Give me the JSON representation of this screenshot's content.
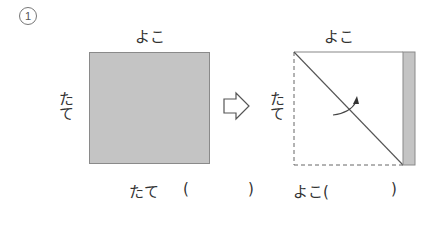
{
  "problem": {
    "number": "1"
  },
  "left_figure": {
    "top_label": "よこ",
    "side_label": "たて"
  },
  "right_figure": {
    "top_label": "よこ",
    "side_label": "たて"
  },
  "answers": {
    "tate_label": "たて",
    "tate_open": "(",
    "tate_close": ")",
    "yoko_label": "よこ(",
    "yoko_close": ")"
  },
  "colors": {
    "fill_gray": "#c4c4c4",
    "line": "#555555"
  }
}
